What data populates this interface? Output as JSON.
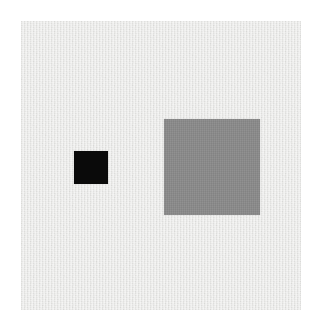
{
  "image": {
    "kind": "visual-stimulus",
    "description": "Two solid squares of different size and lightness on a light gray noisy background panel",
    "width": 322,
    "height": 329,
    "outer_background_color": "#ffffff"
  },
  "panel": {
    "name": "background-panel",
    "color": "#e6e6e4",
    "texture": "fine grain noise",
    "x": 21,
    "y": 21,
    "width": 280,
    "height": 289
  },
  "shapes": [
    {
      "id": "small-dark-square",
      "label": "small dark square",
      "shape": "square",
      "color": "#0a0a0a",
      "x": 74,
      "y": 151,
      "width": 34,
      "height": 33
    },
    {
      "id": "large-gray-square",
      "label": "large gray square",
      "shape": "square",
      "color": "#8b8b8b",
      "x": 164,
      "y": 119,
      "width": 96,
      "height": 96
    }
  ]
}
